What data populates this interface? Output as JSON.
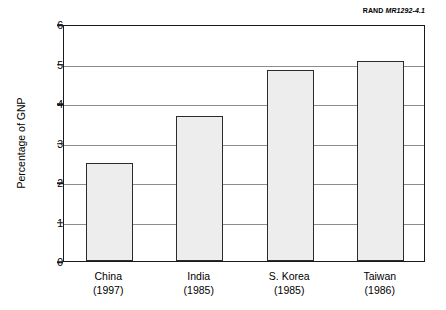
{
  "source_credit": {
    "organization": "RAND",
    "document_id": "MR1292-4.1"
  },
  "chart_data": {
    "type": "bar",
    "title": "",
    "subtitle": "",
    "xlabel": "",
    "ylabel": "Percentage of GNP",
    "categories": [
      "China",
      "India",
      "S. Korea",
      "Taiwan"
    ],
    "category_sublabels": [
      "(1997)",
      "(1985)",
      "(1985)",
      "(1986)"
    ],
    "values": [
      2.47,
      3.67,
      4.83,
      5.07
    ],
    "ylim": [
      0,
      6
    ],
    "yticks": [
      0,
      1,
      2,
      3,
      4,
      5,
      6
    ],
    "ytick_labels": [
      "0",
      "1",
      "2",
      "3",
      "4",
      "5",
      "6"
    ],
    "grid": true,
    "grid_axis": "y",
    "legend": false,
    "legend_position": "none",
    "bar_fill_color": "#ededed",
    "bar_border_color": "#2b2b2b",
    "gridline_color": "#8c8c8c",
    "frame_color": "#1a1a1a"
  }
}
